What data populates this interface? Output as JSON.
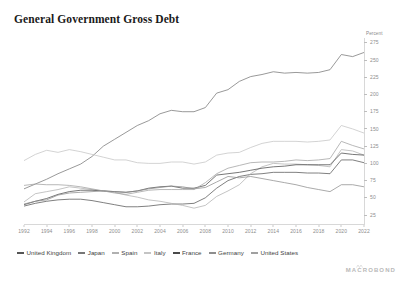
{
  "title": "General Government Gross Debt",
  "axis": {
    "unit_label": "Percent",
    "y_ticks": [
      275,
      250,
      225,
      200,
      175,
      150,
      125,
      100,
      75,
      50,
      25
    ],
    "x_ticks": [
      1992,
      1994,
      1996,
      1998,
      2000,
      2002,
      2004,
      2006,
      2008,
      2010,
      2012,
      2014,
      2016,
      2018,
      2020,
      2022
    ]
  },
  "watermark": {
    "text": "MACROBOND"
  },
  "legend": [
    {
      "label": "United Kingdom",
      "color": "#555555"
    },
    {
      "label": "Japan",
      "color": "#777777"
    },
    {
      "label": "Spain",
      "color": "#b0b0b0"
    },
    {
      "label": "Italy",
      "color": "#c4c4c4"
    },
    {
      "label": "France",
      "color": "#4a4a4a"
    },
    {
      "label": "Germany",
      "color": "#8e8e8e"
    },
    {
      "label": "United States",
      "color": "#a0a0a0"
    }
  ],
  "chart_data": {
    "type": "line",
    "title": "General Government Gross Debt",
    "xlabel": "",
    "ylabel": "Percent",
    "ylim": [
      12,
      282
    ],
    "xlim": [
      1992,
      2022
    ],
    "grid": false,
    "legend_position": "bottom",
    "x": [
      1992,
      1993,
      1994,
      1995,
      1996,
      1997,
      1998,
      1999,
      2000,
      2001,
      2002,
      2003,
      2004,
      2005,
      2006,
      2007,
      2008,
      2009,
      2010,
      2011,
      2012,
      2013,
      2014,
      2015,
      2016,
      2017,
      2018,
      2019,
      2020,
      2021,
      2022
    ],
    "series": [
      {
        "name": "United Kingdom",
        "color": "#555555",
        "values": [
          38,
          42,
          45,
          47,
          48,
          48,
          46,
          43,
          40,
          37,
          37,
          38,
          40,
          41,
          41,
          42,
          50,
          64,
          75,
          81,
          84,
          85,
          87,
          87,
          87,
          86,
          86,
          85,
          105,
          105,
          101
        ]
      },
      {
        "name": "Japan",
        "color": "#777777",
        "values": [
          63,
          70,
          77,
          85,
          92,
          99,
          110,
          125,
          135,
          145,
          155,
          162,
          172,
          177,
          175,
          175,
          181,
          202,
          207,
          219,
          226,
          229,
          233,
          231,
          232,
          231,
          232,
          236,
          258,
          255,
          261
        ]
      },
      {
        "name": "Spain",
        "color": "#b0b0b0",
        "values": [
          44,
          56,
          59,
          62,
          66,
          64,
          62,
          60,
          58,
          54,
          51,
          47,
          45,
          42,
          39,
          35,
          39,
          52,
          60,
          69,
          85,
          95,
          100,
          99,
          99,
          98,
          97,
          95,
          120,
          118,
          112
        ]
      },
      {
        "name": "Italy",
        "color": "#c4c4c4",
        "values": [
          104,
          113,
          119,
          116,
          120,
          117,
          113,
          109,
          105,
          105,
          101,
          100,
          100,
          102,
          102,
          99,
          102,
          112,
          115,
          116,
          123,
          129,
          132,
          132,
          132,
          131,
          132,
          134,
          155,
          150,
          144
        ]
      },
      {
        "name": "France",
        "color": "#4a4a4a",
        "values": [
          40,
          45,
          49,
          55,
          59,
          61,
          61,
          60,
          59,
          58,
          60,
          64,
          66,
          67,
          64,
          64,
          68,
          83,
          85,
          87,
          90,
          93,
          95,
          96,
          98,
          98,
          98,
          98,
          115,
          113,
          112
        ]
      },
      {
        "name": "Germany",
        "color": "#8e8e8e",
        "values": [
          41,
          45,
          47,
          54,
          57,
          58,
          59,
          60,
          59,
          58,
          60,
          63,
          65,
          67,
          66,
          63,
          65,
          73,
          81,
          79,
          81,
          78,
          75,
          72,
          69,
          65,
          62,
          59,
          69,
          69,
          66
        ]
      },
      {
        "name": "United States",
        "color": "#a0a0a0",
        "values": [
          68,
          70,
          69,
          69,
          68,
          66,
          63,
          60,
          57,
          55,
          58,
          61,
          62,
          62,
          62,
          62,
          72,
          85,
          93,
          97,
          101,
          102,
          102,
          103,
          105,
          104,
          105,
          107,
          132,
          126,
          121
        ]
      }
    ]
  }
}
